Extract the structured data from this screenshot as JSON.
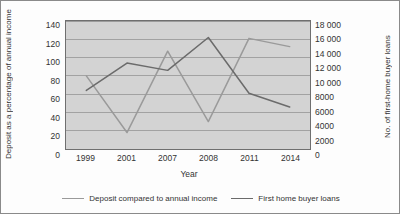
{
  "chart_data": {
    "type": "line",
    "title": "",
    "xlabel": "Year",
    "categories": [
      "1999",
      "2001",
      "2007",
      "2008",
      "2011",
      "2014"
    ],
    "grid": true,
    "legend_position": "bottom",
    "axes": {
      "left": {
        "label_line1": "Deposit as a percentage of",
        "label_line2": "annual income",
        "label": "Deposit as a percentage of annual income",
        "ylim": [
          0,
          140
        ],
        "tick_step": 20,
        "ticks": [
          "140",
          "120",
          "100",
          "80",
          "60",
          "40",
          "20",
          "0"
        ]
      },
      "right": {
        "label": "No. of first-home buyer loans",
        "ylim": [
          0,
          18000
        ],
        "tick_step": 2000,
        "ticks": [
          "18 000",
          "16 000",
          "14 000",
          "12 000",
          "10 000",
          "8000",
          "6000",
          "4000",
          "2000",
          "0"
        ]
      }
    },
    "series": [
      {
        "name": "Deposit compared to annual income",
        "axis": "left",
        "color": "#9a9a9a",
        "values": [
          80,
          18,
          107,
          30,
          121,
          112
        ]
      },
      {
        "name": "First home buyer loans",
        "axis": "right",
        "color": "#6b6b6b",
        "values": [
          8200,
          12100,
          11100,
          15700,
          7800,
          5900
        ],
        "values_on_left_scale": [
          64,
          94,
          86,
          122,
          61,
          46
        ]
      }
    ]
  },
  "legend": {
    "items": [
      {
        "label": "Deposit compared to annual income",
        "color": "#9a9a9a"
      },
      {
        "label": "First home buyer loans",
        "color": "#6b6b6b"
      }
    ]
  }
}
